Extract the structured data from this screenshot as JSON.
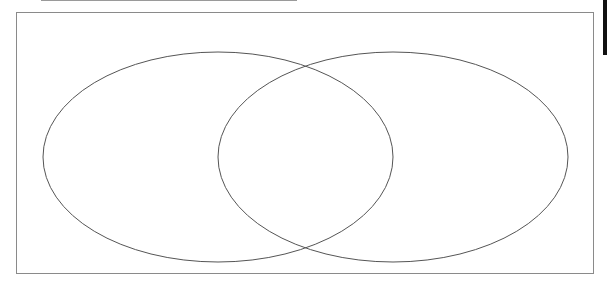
{
  "diagram": {
    "type": "venn",
    "sets": [
      {
        "name": "left-set",
        "cx": 218,
        "cy": 157,
        "rx": 175,
        "ry": 105
      },
      {
        "name": "right-set",
        "cx": 393,
        "cy": 157,
        "rx": 175,
        "ry": 105
      }
    ],
    "stroke_color": "#555555",
    "frame_color": "#8a8a8a"
  }
}
